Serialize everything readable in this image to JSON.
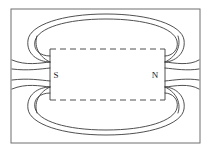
{
  "figure": {
    "background_color": "#ffffff",
    "line_color": "#3c3c3c",
    "frame_color": "#6e6e6e",
    "label_color": "#1a1a1a"
  },
  "frame": {
    "name": "outer-border",
    "x": 11,
    "y": 9,
    "width": 189,
    "height": 134,
    "stroke_width": 1
  },
  "magnet": {
    "name": "bar-magnet",
    "outline_style": "dashed",
    "x": 50,
    "y": 49,
    "width": 115,
    "height": 51,
    "dash_pattern": "6 4",
    "south_label": "S",
    "north_label": "N",
    "south_label_x": 56,
    "south_label_y": 78,
    "north_label_x": 155,
    "north_label_y": 78,
    "pole_face_left_x": 50,
    "pole_face_right_x": 165,
    "pole_face_top_y": 62,
    "pole_face_bottom_y": 87
  },
  "field_lines": {
    "name": "magnetic-field-lines",
    "upper_loops": [
      "M 50 62 C 38 62 26 54 28 40 C 30 25 62 14 106 14 C 150 14 182 25 184 40 C 186 54 174 62 165 62",
      "M 50 56 C 40 56 33 50 35 41 C 38 28 66 19 106 19 C 146 19 174 28 177 41 C 179 50 172 56 165 56"
    ],
    "lower_loops": [
      "M 50 87 C 38 87 26 95 28 109 C 30 124 62 135 106 135 C 150 135 182 124 184 109 C 186 95 174 87 165 87",
      "M 50 93 C 40 93 33 99 35 108 C 38 121 66 130 106 130 C 146 130 174 121 177 108 C 179 99 172 93 165 93"
    ],
    "left_outflows": [
      "M 50 62 C 40 63 26 66 12 60",
      "M 50 68 C 40 69 28 71 12 69",
      "M 50 81 C 40 80 28 78 12 80",
      "M 50 87 C 40 86 26 83 12 89"
    ],
    "right_outflows": [
      "M 165 62 C 175 63 189 66 199 60",
      "M 165 68 C 175 69 187 71 199 69",
      "M 165 81 C 175 80 187 78 199 80",
      "M 165 87 C 175 86 189 83 199 89"
    ],
    "left_near_curves": [
      "M 50 62 C 41 58 33 48 37 36",
      "M 50 87 C 41 91 33 101 37 113"
    ],
    "right_near_curves": [
      "M 165 62 C 174 58 182 48 178 36",
      "M 165 87 C 174 91 182 101 178 113"
    ],
    "stroke_width": 0.9
  }
}
